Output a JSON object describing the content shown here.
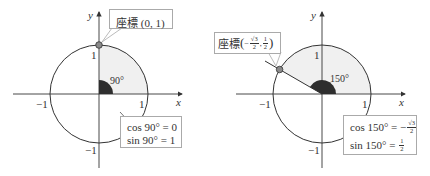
{
  "diagrams": [
    {
      "angle_deg": 90,
      "angle_label": "90°",
      "point_label": {
        "prefix": "座標",
        "text": "(0, 1)"
      },
      "axis_labels": {
        "x": "x",
        "y": "y"
      },
      "tick_labels": {
        "x_neg": "−1",
        "x_pos": "1",
        "y_pos": "1",
        "y_neg": "−1"
      },
      "values": {
        "cos": "cos 90° = 0",
        "sin": "sin 90° = 1"
      }
    },
    {
      "angle_deg": 150,
      "angle_label": "150°",
      "point_label": {
        "prefix": "座標",
        "open": "(",
        "x_sign": "−",
        "x_num": "√3",
        "x_den": "2",
        "sep": ",",
        "y_num": "1",
        "y_den": "2",
        "close": ")"
      },
      "axis_labels": {
        "x": "x",
        "y": "y"
      },
      "tick_labels": {
        "x_neg": "−1",
        "x_pos": "1",
        "y_pos": "1",
        "y_neg": "−1"
      },
      "values": {
        "cos_prefix": "cos 150° = −",
        "cos_num": "√3",
        "cos_den": "2",
        "sin_prefix": "sin 150° = ",
        "sin_num": "1",
        "sin_den": "2"
      }
    }
  ],
  "colors": {
    "axis": "#333333",
    "circle": "#333333",
    "sector_fill": "#f0f0f0",
    "angle_wedge": "#2e2e2e",
    "point": "#8a8a8a"
  }
}
